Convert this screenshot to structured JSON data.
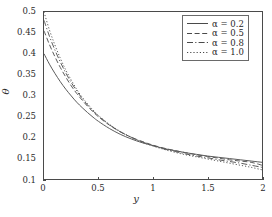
{
  "chart_data": {
    "type": "line",
    "title": "",
    "xlabel": "y",
    "ylabel": "θ",
    "xlim": [
      0,
      2
    ],
    "ylim": [
      0.1,
      0.5
    ],
    "xticks": [
      "0",
      "0.5",
      "1",
      "1.5",
      "2"
    ],
    "xtick_values": [
      0,
      0.5,
      1,
      1.5,
      2
    ],
    "yticks": [
      "0.1",
      "0.15",
      "0.2",
      "0.25",
      "0.3",
      "0.35",
      "0.4",
      "0.45",
      "0.5"
    ],
    "ytick_values": [
      0.1,
      0.15,
      0.2,
      0.25,
      0.3,
      0.35,
      0.4,
      0.45,
      0.5
    ],
    "grid": false,
    "legend_position": "top-right",
    "x": [
      0,
      0.05,
      0.1,
      0.15,
      0.2,
      0.25,
      0.3,
      0.35,
      0.4,
      0.45,
      0.5,
      0.6,
      0.7,
      0.8,
      0.9,
      1.0,
      1.1,
      1.2,
      1.3,
      1.4,
      1.5,
      1.6,
      1.7,
      1.8,
      1.9,
      2.0
    ],
    "series": [
      {
        "name": "α = 0.2",
        "alpha": 0.2,
        "style": "solid",
        "color": "#595959",
        "values": [
          0.4,
          0.375,
          0.353,
          0.333,
          0.315,
          0.299,
          0.284,
          0.271,
          0.259,
          0.248,
          0.238,
          0.221,
          0.207,
          0.196,
          0.187,
          0.18,
          0.173,
          0.168,
          0.163,
          0.159,
          0.155,
          0.152,
          0.149,
          0.146,
          0.143,
          0.14
        ]
      },
      {
        "name": "α = 0.5",
        "alpha": 0.5,
        "style": "dashed",
        "color": "#595959",
        "values": [
          0.455,
          0.422,
          0.393,
          0.367,
          0.344,
          0.323,
          0.305,
          0.289,
          0.274,
          0.261,
          0.249,
          0.229,
          0.213,
          0.2,
          0.19,
          0.181,
          0.174,
          0.168,
          0.163,
          0.158,
          0.154,
          0.15,
          0.146,
          0.143,
          0.14,
          0.133
        ]
      },
      {
        "name": "α = 0.8",
        "alpha": 0.8,
        "style": "dashdot",
        "color": "#595959",
        "values": [
          0.48,
          0.442,
          0.409,
          0.38,
          0.354,
          0.331,
          0.311,
          0.293,
          0.277,
          0.263,
          0.251,
          0.23,
          0.213,
          0.2,
          0.189,
          0.18,
          0.172,
          0.166,
          0.16,
          0.155,
          0.151,
          0.146,
          0.142,
          0.138,
          0.133,
          0.128
        ]
      },
      {
        "name": "α = 1.0",
        "alpha": 1.0,
        "style": "dotted",
        "color": "#595959",
        "values": [
          0.5,
          0.457,
          0.421,
          0.389,
          0.361,
          0.337,
          0.315,
          0.296,
          0.28,
          0.265,
          0.252,
          0.231,
          0.214,
          0.2,
          0.188,
          0.179,
          0.171,
          0.164,
          0.158,
          0.153,
          0.148,
          0.143,
          0.138,
          0.133,
          0.128,
          0.122
        ]
      }
    ]
  },
  "legend": {
    "entries": [
      {
        "label": "α = 0.2",
        "style": "solid"
      },
      {
        "label": "α = 0.5",
        "style": "dashed"
      },
      {
        "label": "α = 0.8",
        "style": "dashdot"
      },
      {
        "label": "α = 1.0",
        "style": "dotted"
      }
    ]
  },
  "caption": {
    "clipped_text": ""
  }
}
